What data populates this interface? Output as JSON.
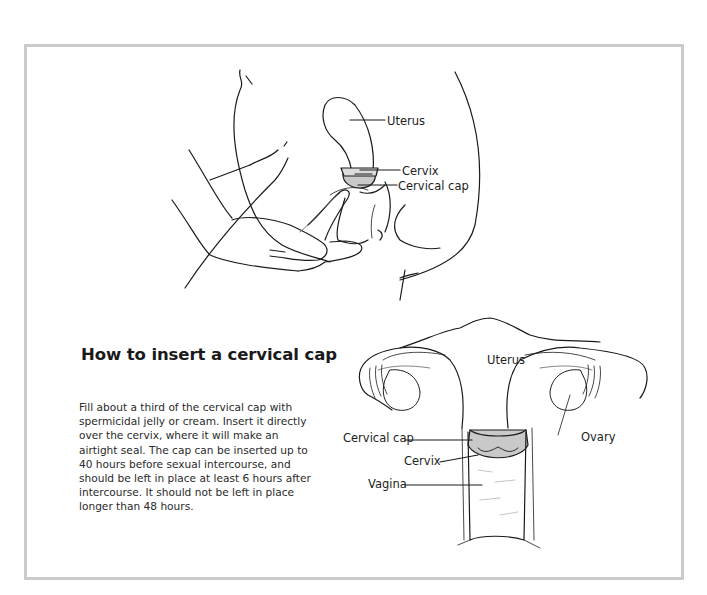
{
  "figure": {
    "title": "How to insert a cervical cap",
    "description": "Fill about a third of the cervical cap with spermicidal jelly or cream. Insert it directly over the cervix, where it will make an airtight seal. The cap can be inserted up to 40 hours before sexual intercourse, and should be left in place at least 6 hours after intercourse. It should not be left in place longer than 48 hours.",
    "side_view": {
      "labels": {
        "uterus": "Uterus",
        "cervix": "Cervix",
        "cervical_cap": "Cervical cap"
      }
    },
    "front_view": {
      "labels": {
        "uterus": "Uterus",
        "ovary": "Ovary",
        "cervical_cap": "Cervical cap",
        "cervix": "Cervix",
        "vagina": "Vagina"
      }
    },
    "colors": {
      "frame_border": "#cbcbcb",
      "cap_fill": "#c9c9c9",
      "line": "#1a1a1a"
    }
  }
}
